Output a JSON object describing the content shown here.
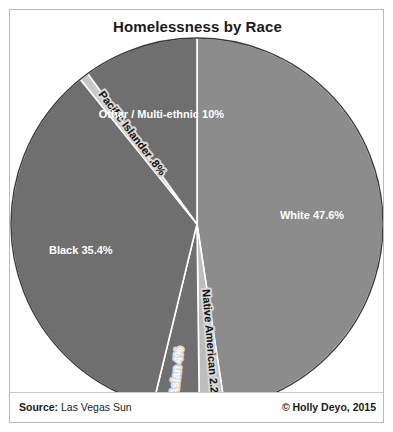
{
  "chart_data": {
    "type": "pie",
    "title": "Homelessness by Race",
    "categories": [
      "White",
      "Native American",
      "Asian",
      "Black",
      "Pacific Islander",
      "Other / Multi-ethnic"
    ],
    "values": [
      47.6,
      2.2,
      4,
      35.4,
      0.8,
      10
    ],
    "labels": [
      "White 47.6%",
      "Native American 2.2%",
      "Asian 4%",
      "Black 35.4%",
      "Pacific Islander .8%",
      "Other / Multi-ethnic 10%"
    ],
    "slice_colors": [
      "#8c8c8c",
      "#bdbdbd",
      "#6f6f6f",
      "#6f6f6f",
      "#c9c9c9",
      "#6f6f6f"
    ],
    "label_text_colors": [
      "#ffffff",
      "#111111",
      "#ffffff",
      "#ffffff",
      "#111111",
      "#ffffff"
    ],
    "start_angle_deg": 0,
    "direction": "clockwise",
    "grid": false,
    "legend": "none",
    "xlabel": "",
    "ylabel": ""
  },
  "footer": {
    "source_key": "Source:",
    "source_value": " Las Vegas Sun",
    "credit": "© Holly Deyo, 2015"
  },
  "colors": {
    "card_border": "#b9b9b9",
    "background": "#ffffff",
    "title_color": "#1b1b1b",
    "slice_outline": "#ffffff",
    "pie_edge": "#3a3a3a"
  }
}
